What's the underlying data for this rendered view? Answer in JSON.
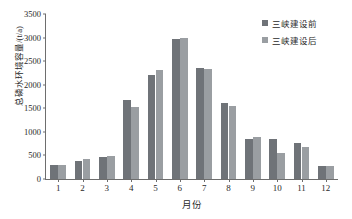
{
  "chart_data": {
    "type": "bar",
    "title": "",
    "xlabel": "月份",
    "ylabel": "总磷水环境容量/(t/a)",
    "categories": [
      "1",
      "2",
      "3",
      "4",
      "5",
      "6",
      "7",
      "8",
      "9",
      "10",
      "11",
      "12"
    ],
    "series": [
      {
        "name": "三峡建设前",
        "color": "#6f7378",
        "values": [
          290,
          390,
          465,
          1670,
          2210,
          2975,
          2365,
          1615,
          855,
          840,
          770,
          275
        ]
      },
      {
        "name": "三峡建设后",
        "color": "#9a9ea2",
        "values": [
          305,
          415,
          480,
          1520,
          2310,
          2990,
          2330,
          1545,
          890,
          560,
          680,
          275
        ]
      }
    ],
    "ylim": [
      0,
      3500
    ],
    "yticks": [
      "0",
      "500",
      "1000",
      "1500",
      "2000",
      "2500",
      "3000",
      "3500"
    ],
    "ytick_values": [
      0,
      500,
      1000,
      1500,
      2000,
      2500,
      3000,
      3500
    ],
    "grid": false,
    "legend_position": "top-right"
  },
  "legend": {
    "items": [
      {
        "label": "三峡建设前"
      },
      {
        "label": "三峡建设后"
      }
    ]
  },
  "axes": {
    "x_title": "月份",
    "y_title": "总磷水环境容量/(t/a)"
  },
  "colors": {
    "series_before": "#6f7378",
    "series_after": "#9a9ea2",
    "axis": "#6e6e6e",
    "text": "#2a2a2a",
    "background": "#ffffff"
  }
}
